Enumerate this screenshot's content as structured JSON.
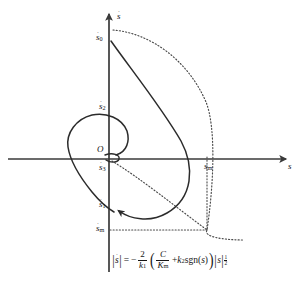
{
  "figure": {
    "type": "phase-portrait",
    "title": "",
    "axes": {
      "x_label": "s",
      "y_label": "s-dot",
      "x_label_display": "s",
      "y_label_display": "ṡ",
      "origin_label": "O",
      "origin_px": [
        109,
        159
      ],
      "x_axis_from_px": [
        8,
        159
      ],
      "x_axis_to_px": [
        288,
        159
      ],
      "y_axis_from_px": [
        109,
        270
      ],
      "y_axis_to_px": [
        109,
        12
      ]
    },
    "point_labels": [
      {
        "name": "s0-dot",
        "base": "s",
        "sub": "0",
        "dot": true,
        "x": 96,
        "y": 34,
        "anchor_px": [
          109,
          40
        ]
      },
      {
        "name": "s2-dot",
        "base": "s",
        "sub": "2",
        "dot": true,
        "x": 100,
        "y": 103,
        "anchor_px": [
          109,
          110
        ]
      },
      {
        "name": "s3-dot",
        "base": "s",
        "sub": "3",
        "dot": true,
        "x": 100,
        "y": 166,
        "anchor_px": [
          109,
          163
        ]
      },
      {
        "name": "s1-dot",
        "base": "s",
        "sub": "1",
        "dot": true,
        "x": 100,
        "y": 202,
        "anchor_px": [
          112,
          209
        ]
      },
      {
        "name": "sm-dot",
        "base": "s",
        "sub": "m",
        "dot": true,
        "x": 97,
        "y": 225,
        "anchor_px": [
          109,
          230
        ]
      },
      {
        "name": "sm",
        "base": "s",
        "sub": "m",
        "dot": false,
        "x": 205,
        "y": 162,
        "anchor_px": [
          207,
          159
        ]
      }
    ],
    "equation": {
      "lhs_bar": "|",
      "lhs_var": "s",
      "lhs_dot": true,
      "equals": "=",
      "minus": "−",
      "frac1_num": "2",
      "frac1_den_var": "k",
      "frac1_den_sub": "1",
      "open_paren": "(",
      "frac2_num": "C",
      "frac2_den_var": "K",
      "frac2_den_sub": "m",
      "plus": "+",
      "k2_var": "k",
      "k2_sub": "2",
      "sgn": "sgn",
      "sgn_open": "(",
      "sgn_var": "s",
      "sgn_close": ")",
      "close_paren": ")",
      "abs_open": "|",
      "abs_var": "s",
      "abs_close": "|",
      "exp_num": "1",
      "exp_den": "2",
      "plain_text": "|ṡ| = − (2/k₁)( C/Kₘ + k₂sgn(s) )|s|^(1/2)"
    },
    "colors": {
      "axis": "#3a3a3a",
      "solid_curve": "#2b2b2b",
      "dotted_curve": "#4a4a4a",
      "text": "#141414",
      "background": "#ffffff"
    },
    "curves": [
      {
        "name": "solid-trajectory",
        "style": "solid",
        "description": "spiral trajectory from s0-dot on positive y-axis, sweeping right through positive s, curling back to s1-dot on negative y-axis with arrowhead"
      },
      {
        "name": "left-loop",
        "style": "solid",
        "description": "closed loop left of the axis from s2-dot down through negative s back toward s1-dot"
      },
      {
        "name": "switching-parabola-upper",
        "style": "dotted",
        "description": "dotted parabolic boundary arc from near s0-dot curving right and down through (s_m, s_m-dot)"
      },
      {
        "name": "switching-parabola-lower",
        "style": "dotted",
        "description": "dotted branch from origin descending to the right past s_m"
      },
      {
        "name": "sm-guide-vertical",
        "style": "dotted",
        "description": "vertical dotted guide line at s = s_m"
      },
      {
        "name": "smdot-guide-horizontal",
        "style": "dotted",
        "description": "horizontal dotted guide line at s-dot = s_m-dot"
      }
    ]
  }
}
